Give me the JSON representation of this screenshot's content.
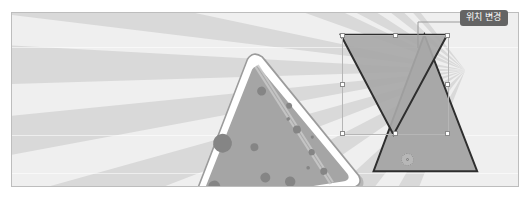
{
  "app": {
    "canvas_label": "slide-canvas",
    "background_style": "sunburst rays"
  },
  "tooltip": {
    "text": "위치 변경",
    "background_color": "#646464",
    "text_color": "#ffffff"
  },
  "colors": {
    "canvas_background": "#e9e9e9",
    "ray_light": "#efefef",
    "ray_dark": "#d8d8d8",
    "shape_fill": "#a8a8a8",
    "shape_stroke": "#2e2e2e",
    "pizza_fill": "#a5a5a5",
    "pizza_crust": "#ffffff",
    "pizza_topping": "#8b8b8b",
    "handle_fill": "#ffffff",
    "handle_stroke": "#8a8a8a",
    "selection_stroke": "#b6b6b6",
    "canvas_border": "#bdbdbd"
  },
  "shapes": {
    "pizza_slice": {
      "name": "pizza slice",
      "topping_count": 13
    },
    "triangle_down": {
      "name": "inverted triangle",
      "selected": true,
      "points": "341,34 448,34 394,135"
    },
    "triangle_up": {
      "name": "triangle",
      "selected": false,
      "points": "425,34 478,172 374,172"
    }
  },
  "selection": {
    "label": "selection-bounding-box",
    "x": 341,
    "y": 34,
    "width": 107,
    "height": 100,
    "handles": [
      "top-left",
      "top-center",
      "top-right",
      "middle-left",
      "middle-right",
      "bottom-left",
      "bottom-center",
      "bottom-right"
    ]
  },
  "cursor": {
    "type": "move-rotate"
  }
}
